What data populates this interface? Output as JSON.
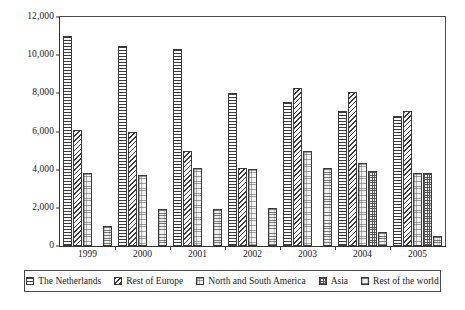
{
  "chart_data": {
    "type": "bar",
    "title": "",
    "subtitle": "",
    "xlabel": "",
    "ylabel": "",
    "grid": false,
    "legend_position": "bottom",
    "categories": [
      "1999",
      "2000",
      "2001",
      "2002",
      "2003",
      "2004",
      "2005"
    ],
    "ylim": [
      0,
      12000
    ],
    "ytick_values": [
      0,
      2000,
      4000,
      6000,
      8000,
      10000,
      12000
    ],
    "ytick_labels": [
      "0",
      "2,000",
      "4,000",
      "6,000",
      "8,000",
      "10,000",
      "12,000"
    ],
    "series": [
      {
        "name": "The Netherlands",
        "pattern": "horizontal-lines",
        "values": [
          11000,
          10500,
          10300,
          8000,
          7550,
          7050,
          6800
        ]
      },
      {
        "name": "Rest of Europe",
        "pattern": "diagonal-lines",
        "values": [
          6100,
          6000,
          5000,
          4100,
          8300,
          8050,
          7050
        ]
      },
      {
        "name": "North and South America",
        "pattern": "light-grid",
        "values": [
          3800,
          3700,
          4100,
          4050,
          5000,
          4350,
          3800
        ]
      },
      {
        "name": "Asia",
        "pattern": "checker",
        "values": [
          0,
          0,
          0,
          0,
          0,
          3950,
          3800
        ]
      },
      {
        "name": "Rest of the world",
        "pattern": "dotted",
        "values": [
          1050,
          1950,
          1950,
          2000,
          4100,
          750,
          550
        ]
      }
    ]
  },
  "legend": {
    "items": [
      {
        "label": "The Netherlands"
      },
      {
        "label": "Rest of Europe"
      },
      {
        "label": "North and South America"
      },
      {
        "label": "Asia"
      },
      {
        "label": "Rest of the world"
      }
    ]
  },
  "colors": {
    "axis": "#333333",
    "frame": "#4a4a4a",
    "background": "#ffffff",
    "bar_outline": "#3a3a3a"
  }
}
